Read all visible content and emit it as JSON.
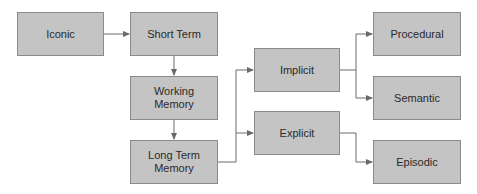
{
  "diagram": {
    "nodes": [
      {
        "id": "iconic",
        "label": "Iconic",
        "x": 17,
        "y": 12,
        "w": 87,
        "h": 44
      },
      {
        "id": "short-term",
        "label": "Short Term",
        "x": 130,
        "y": 12,
        "w": 88,
        "h": 44
      },
      {
        "id": "working-memory",
        "label": "Working Memory",
        "x": 130,
        "y": 76,
        "w": 88,
        "h": 44
      },
      {
        "id": "long-term-memory",
        "label": "Long Term Memory",
        "x": 130,
        "y": 140,
        "w": 88,
        "h": 44
      },
      {
        "id": "implicit",
        "label": "Implicit",
        "x": 254,
        "y": 48,
        "w": 86,
        "h": 44
      },
      {
        "id": "explicit",
        "label": "Explicit",
        "x": 254,
        "y": 111,
        "w": 86,
        "h": 44
      },
      {
        "id": "procedural",
        "label": "Procedural",
        "x": 373,
        "y": 12,
        "w": 88,
        "h": 44
      },
      {
        "id": "semantic",
        "label": "Semantic",
        "x": 373,
        "y": 76,
        "w": 88,
        "h": 44
      },
      {
        "id": "episodic",
        "label": "Episodic",
        "x": 373,
        "y": 140,
        "w": 88,
        "h": 44
      }
    ],
    "edges": [
      {
        "from": "iconic",
        "to": "short-term"
      },
      {
        "from": "short-term",
        "to": "working-memory"
      },
      {
        "from": "working-memory",
        "to": "long-term-memory"
      },
      {
        "from": "long-term-memory",
        "to": "implicit"
      },
      {
        "from": "long-term-memory",
        "to": "explicit"
      },
      {
        "from": "implicit",
        "to": "procedural"
      },
      {
        "from": "implicit",
        "to": "semantic"
      },
      {
        "from": "explicit",
        "to": "episodic"
      }
    ],
    "colors": {
      "box_fill": "#c4c4c4",
      "box_border": "#8a8a8a",
      "line": "#6a6a6a"
    }
  },
  "labels": {
    "iconic": "Iconic",
    "short_term": "Short Term",
    "working_memory": "Working\nMemory",
    "long_term": "Long Term\nMemory",
    "implicit": "Implicit",
    "explicit": "Explicit",
    "procedural": "Procedural",
    "semantic": "Semantic",
    "episodic": "Episodic"
  }
}
